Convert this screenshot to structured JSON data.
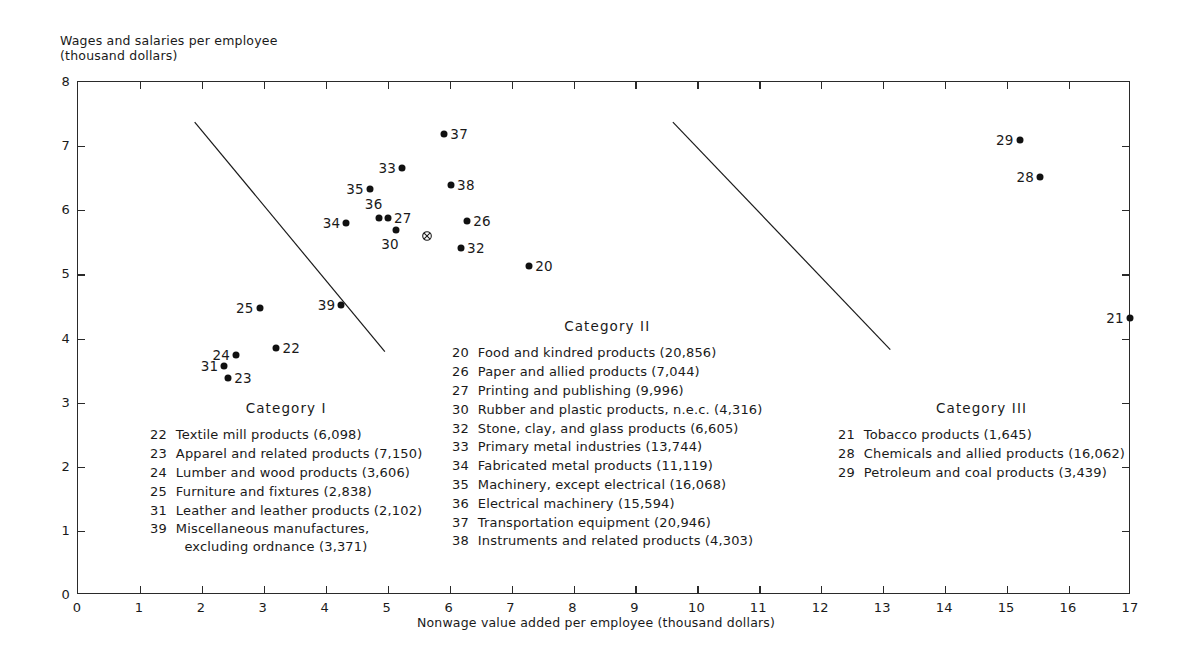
{
  "chart_data": {
    "type": "scatter",
    "title": "",
    "xlabel": "Nonwage value added per employee (thousand dollars)",
    "ylabel": "Wages and salaries per employee\n(thousand dollars)",
    "xlim": [
      0,
      17
    ],
    "ylim": [
      0,
      8
    ],
    "xticks": [
      0,
      1,
      2,
      3,
      4,
      5,
      6,
      7,
      8,
      9,
      10,
      11,
      12,
      13,
      14,
      15,
      16,
      17
    ],
    "yticks": [
      0,
      1,
      2,
      3,
      4,
      5,
      6,
      7,
      8
    ],
    "grid": false,
    "legend_position": "inside-plot",
    "points": [
      {
        "code": "20",
        "x": 7.3,
        "y": 5.12,
        "label_side": "right"
      },
      {
        "code": "21",
        "x": 17.0,
        "y": 4.3,
        "label_side": "left"
      },
      {
        "code": "22",
        "x": 3.22,
        "y": 3.83,
        "label_side": "right"
      },
      {
        "code": "23",
        "x": 2.44,
        "y": 3.37,
        "label_side": "right"
      },
      {
        "code": "24",
        "x": 2.57,
        "y": 3.73,
        "label_side": "left"
      },
      {
        "code": "25",
        "x": 2.95,
        "y": 4.46,
        "label_side": "left"
      },
      {
        "code": "26",
        "x": 6.3,
        "y": 5.82,
        "label_side": "right"
      },
      {
        "code": "27",
        "x": 5.02,
        "y": 5.86,
        "label_side": "right"
      },
      {
        "code": "28",
        "x": 15.55,
        "y": 6.5,
        "label_side": "left"
      },
      {
        "code": "29",
        "x": 15.22,
        "y": 7.08,
        "label_side": "left"
      },
      {
        "code": "30",
        "x": 5.15,
        "y": 5.68,
        "label_side": "below-left"
      },
      {
        "code": "32",
        "x": 6.2,
        "y": 5.4,
        "label_side": "right"
      },
      {
        "code": "33",
        "x": 5.25,
        "y": 6.65,
        "label_side": "left"
      },
      {
        "code": "34",
        "x": 4.35,
        "y": 5.78,
        "label_side": "left"
      },
      {
        "code": "35",
        "x": 4.73,
        "y": 6.32,
        "label_side": "left"
      },
      {
        "code": "36",
        "x": 4.87,
        "y": 5.86,
        "label_side": "above-left"
      },
      {
        "code": "37",
        "x": 5.93,
        "y": 7.17,
        "label_side": "right"
      },
      {
        "code": "38",
        "x": 6.04,
        "y": 6.38,
        "label_side": "right"
      }
    ],
    "centroid": {
      "x": 5.65,
      "y": 5.65,
      "marker": "circled-x"
    },
    "divider_lines": [
      {
        "x1": 1.9,
        "y1": 7.36,
        "x2": 4.97,
        "y2": 3.78
      },
      {
        "x1": 9.62,
        "y1": 7.36,
        "x2": 13.13,
        "y2": 3.81
      }
    ]
  },
  "axes": {
    "y_title_line1": "Wages and salaries per employee",
    "y_title_line2": "(thousand dollars)",
    "x_title": "Nonwage value added per employee (thousand dollars)",
    "x_tick_labels": [
      "0",
      "1",
      "2",
      "3",
      "4",
      "5",
      "6",
      "7",
      "8",
      "9",
      "10",
      "11",
      "12",
      "13",
      "14",
      "15",
      "16",
      "17"
    ],
    "y_tick_labels": [
      "0",
      "1",
      "2",
      "3",
      "4",
      "5",
      "6",
      "7",
      "8"
    ]
  },
  "legends": [
    {
      "id": "category-1",
      "title": "Category I",
      "entries": [
        {
          "num": "22",
          "text": "Textile mill products (6,098)"
        },
        {
          "num": "23",
          "text": "Apparel and related products (7,150)"
        },
        {
          "num": "24",
          "text": "Lumber and wood products (3,606)"
        },
        {
          "num": "25",
          "text": "Furniture and fixtures (2,838)"
        },
        {
          "num": "31",
          "text": "Leather and leather products (2,102)"
        },
        {
          "num": "39",
          "text": "Miscellaneous manufactures,\n  excluding ordnance (3,371)"
        }
      ]
    },
    {
      "id": "category-2",
      "title": "Category II",
      "entries": [
        {
          "num": "20",
          "text": "Food and kindred products (20,856)"
        },
        {
          "num": "26",
          "text": "Paper and allied products (7,044)"
        },
        {
          "num": "27",
          "text": "Printing and publishing (9,996)"
        },
        {
          "num": "30",
          "text": "Rubber and plastic products, n.e.c. (4,316)"
        },
        {
          "num": "32",
          "text": "Stone, clay, and glass products (6,605)"
        },
        {
          "num": "33",
          "text": "Primary metal industries (13,744)"
        },
        {
          "num": "34",
          "text": "Fabricated metal products (11,119)"
        },
        {
          "num": "35",
          "text": "Machinery, except electrical (16,068)"
        },
        {
          "num": "36",
          "text": "Electrical machinery (15,594)"
        },
        {
          "num": "37",
          "text": "Transportation equipment (20,946)"
        },
        {
          "num": "38",
          "text": "Instruments and related products (4,303)"
        }
      ]
    },
    {
      "id": "category-3",
      "title": "Category III",
      "entries": [
        {
          "num": "21",
          "text": "Tobacco products (1,645)"
        },
        {
          "num": "28",
          "text": "Chemicals and allied products (16,062)"
        },
        {
          "num": "29",
          "text": "Petroleum and coal products (3,439)"
        }
      ]
    }
  ],
  "extra_points": [
    {
      "code": "31",
      "x": 2.38,
      "y": 3.55,
      "label_side": "left"
    },
    {
      "code": "39",
      "x": 4.27,
      "y": 4.51,
      "label_side": "left"
    }
  ],
  "colors": {
    "ink": "#1a1a1a",
    "marker": "#111111",
    "background": "#ffffff"
  }
}
